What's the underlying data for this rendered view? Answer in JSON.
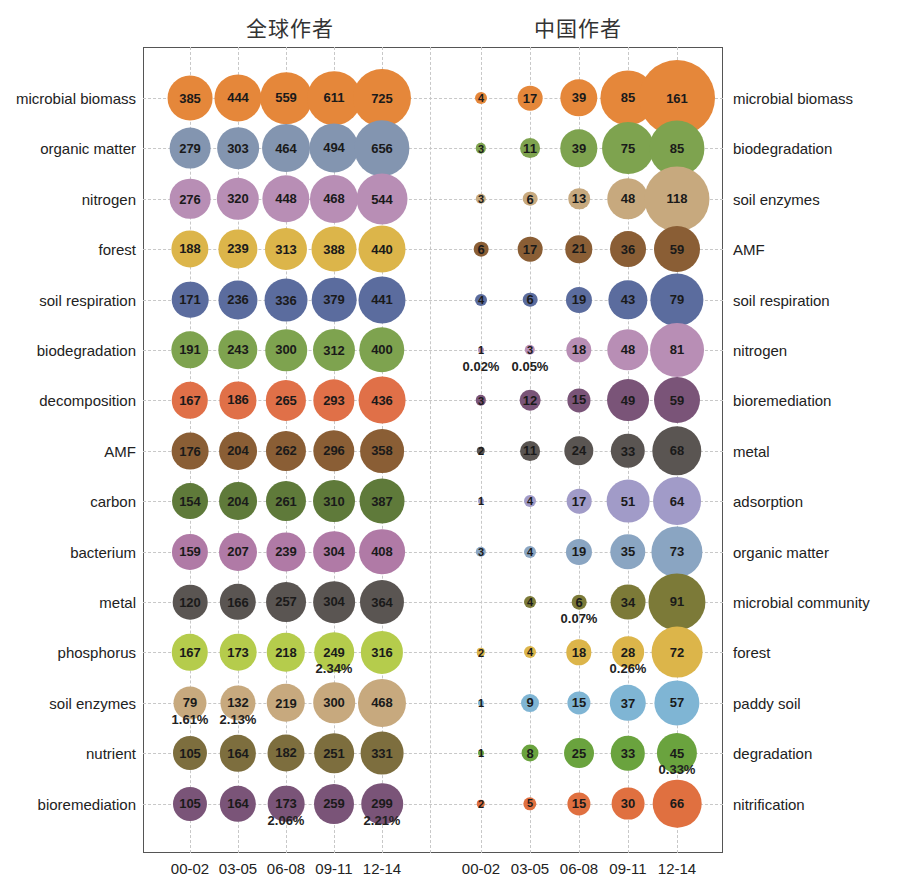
{
  "chart_data": [
    {
      "type": "bubble",
      "title": "全球作者",
      "x": [
        "00-02",
        "03-05",
        "06-08",
        "09-11",
        "12-14"
      ],
      "rows": [
        {
          "label": "microbial biomass",
          "color": "#e5873a",
          "values": [
            385,
            444,
            559,
            611,
            725
          ]
        },
        {
          "label": "organic matter",
          "color": "#8395b0",
          "values": [
            279,
            303,
            464,
            494,
            656
          ]
        },
        {
          "label": "nitrogen",
          "color": "#b88eb5",
          "values": [
            276,
            320,
            448,
            468,
            544
          ]
        },
        {
          "label": "forest",
          "color": "#dcb54a",
          "values": [
            188,
            239,
            313,
            388,
            440
          ]
        },
        {
          "label": "soil respiration",
          "color": "#5b6c9e",
          "values": [
            171,
            236,
            336,
            379,
            441
          ]
        },
        {
          "label": "biodegradation",
          "color": "#7ea34f",
          "values": [
            191,
            243,
            300,
            312,
            400
          ]
        },
        {
          "label": "decomposition",
          "color": "#e07048",
          "values": [
            167,
            186,
            265,
            293,
            436
          ]
        },
        {
          "label": "AMF",
          "color": "#8a5e35",
          "values": [
            176,
            204,
            262,
            296,
            358
          ]
        },
        {
          "label": "carbon",
          "color": "#5f7a3a",
          "values": [
            154,
            204,
            261,
            310,
            387
          ]
        },
        {
          "label": "bacterium",
          "color": "#b07aa6",
          "values": [
            159,
            207,
            239,
            304,
            408
          ]
        },
        {
          "label": "metal",
          "color": "#5a5552",
          "values": [
            120,
            166,
            257,
            304,
            364
          ]
        },
        {
          "label": "phosphorus",
          "color": "#b5cc4c",
          "values": [
            167,
            173,
            218,
            249,
            316
          ],
          "annotations": {
            "3": "2.34%"
          }
        },
        {
          "label": "soil enzymes",
          "color": "#c7a97e",
          "values": [
            79,
            132,
            219,
            300,
            468
          ],
          "annotations": {
            "0": "1.61%",
            "1": "2.13%"
          }
        },
        {
          "label": "nutrient",
          "color": "#7d6e3e",
          "values": [
            105,
            164,
            182,
            251,
            331
          ]
        },
        {
          "label": "bioremediation",
          "color": "#7a5478",
          "values": [
            105,
            164,
            173,
            259,
            299
          ],
          "annotations": {
            "2": "2.06%",
            "4": "2.21%"
          }
        }
      ]
    },
    {
      "type": "bubble",
      "title": "中国作者",
      "x": [
        "00-02",
        "03-05",
        "06-08",
        "09-11",
        "12-14"
      ],
      "rows": [
        {
          "label": "microbial biomass",
          "color": "#e5873a",
          "values": [
            4,
            17,
            39,
            85,
            161
          ]
        },
        {
          "label": "biodegradation",
          "color": "#7ea34f",
          "values": [
            3,
            11,
            39,
            75,
            85
          ]
        },
        {
          "label": "soil enzymes",
          "color": "#c7a97e",
          "values": [
            3,
            6,
            13,
            48,
            118
          ]
        },
        {
          "label": "AMF",
          "color": "#8a5e35",
          "values": [
            6,
            17,
            21,
            36,
            59
          ]
        },
        {
          "label": "soil respiration",
          "color": "#5b6c9e",
          "values": [
            4,
            6,
            19,
            43,
            79
          ]
        },
        {
          "label": "nitrogen",
          "color": "#b88eb5",
          "values": [
            1,
            3,
            18,
            48,
            81
          ],
          "annotations": {
            "0": "0.02%",
            "1": "0.05%"
          }
        },
        {
          "label": "bioremediation",
          "color": "#7a5478",
          "values": [
            3,
            12,
            15,
            49,
            59
          ]
        },
        {
          "label": "metal",
          "color": "#5a5552",
          "values": [
            2,
            11,
            24,
            33,
            68
          ]
        },
        {
          "label": "adsorption",
          "color": "#a19bc8",
          "values": [
            1,
            4,
            17,
            51,
            64
          ]
        },
        {
          "label": "organic matter",
          "color": "#8aa5c2",
          "values": [
            3,
            4,
            19,
            35,
            73
          ]
        },
        {
          "label": "microbial community",
          "color": "#7c7a38",
          "values": [
            null,
            4,
            6,
            34,
            91
          ],
          "annotations": {
            "2": "0.07%"
          }
        },
        {
          "label": "forest",
          "color": "#dcb54a",
          "values": [
            2,
            4,
            18,
            28,
            72
          ],
          "annotations": {
            "3": "0.26%"
          }
        },
        {
          "label": "paddy soil",
          "color": "#7fb5d4",
          "values": [
            1,
            9,
            15,
            37,
            57
          ]
        },
        {
          "label": "degradation",
          "color": "#6aa33e",
          "values": [
            1,
            8,
            25,
            33,
            45
          ],
          "annotations": {
            "4": "0.33%"
          }
        },
        {
          "label": "nitrification",
          "color": "#e07040",
          "values": [
            2,
            5,
            15,
            30,
            66
          ]
        }
      ]
    }
  ]
}
